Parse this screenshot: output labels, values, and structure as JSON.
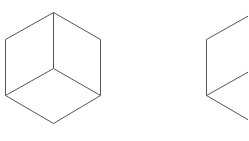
{
  "diagram": {
    "type": "isometric-cube-wireframes",
    "stroke_color": "#555555",
    "background": "#ffffff",
    "cubes": [
      {
        "name": "cube-left",
        "offset_x": 0,
        "vertices": {
          "top": [
            53,
            12
          ],
          "upper_left": [
            5,
            39
          ],
          "upper_right": [
            100,
            39
          ],
          "center": [
            53,
            68
          ],
          "lower_left": [
            5,
            95
          ],
          "lower_right": [
            100,
            95
          ],
          "bottom": [
            53,
            123
          ]
        }
      },
      {
        "name": "cube-right",
        "offset_x": 201,
        "vertices": {
          "top": [
            254,
            12
          ],
          "upper_left": [
            206,
            39
          ],
          "upper_right": [
            301,
            39
          ],
          "center": [
            254,
            68
          ],
          "lower_left": [
            206,
            95
          ],
          "lower_right": [
            301,
            95
          ],
          "bottom": [
            254,
            123
          ]
        }
      }
    ]
  }
}
